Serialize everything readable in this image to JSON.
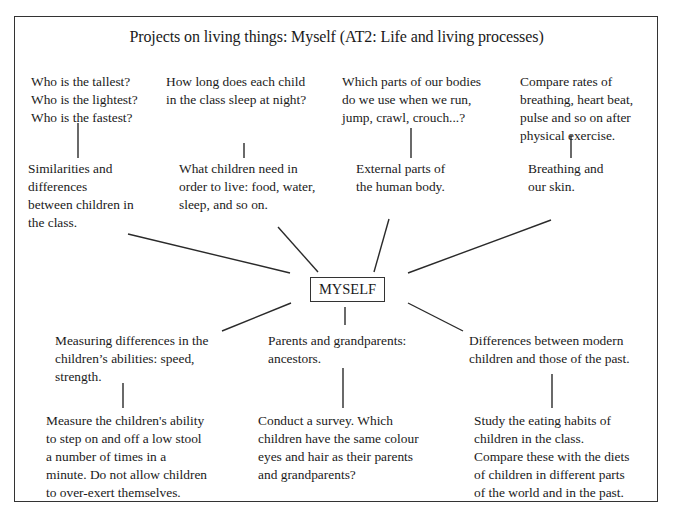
{
  "diagram": {
    "title": "Projects on living things: Myself (AT2: Life and living processes)",
    "center": "MYSELF",
    "top_branches": [
      {
        "question": "Who is the tallest?\nWho is the lightest?\nWho is the fastest?",
        "topic": "Similarities and\ndifferences\nbetween children in\nthe class."
      },
      {
        "question": "How long does each child\nin the class sleep at night?",
        "topic": "What children need in\norder to live: food, water,\nsleep, and so on."
      },
      {
        "question": "Which parts of our bodies\ndo we use when we run,\njump, crawl, crouch...?",
        "topic": "External parts of\nthe human body."
      },
      {
        "question": "Compare rates of\nbreathing, heart beat,\npulse and so on after\nphysical exercise.",
        "topic": "Breathing and\nour skin."
      }
    ],
    "bottom_branches": [
      {
        "topic": "Measuring differences in the\nchildren’s abilities: speed,\nstrength.",
        "activity": "Measure the children's ability\nto step on and off a low stool\na number of times in a\nminute. Do not allow children\nto over-exert themselves."
      },
      {
        "topic": "Parents and grandparents:\nancestors.",
        "activity": "Conduct a survey. Which\nchildren have the same colour\neyes and hair as their parents\nand grandparents?"
      },
      {
        "topic": "Differences between modern\nchildren and those of the past.",
        "activity": "Study the eating habits of\nchildren in the class.\nCompare these with the diets\nof children in different parts\nof the world and in the past."
      }
    ]
  }
}
